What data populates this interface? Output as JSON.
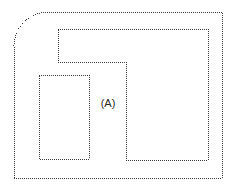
{
  "figure": {
    "width": 232,
    "height": 185,
    "background_color": "#ffffff",
    "stroke_color": "#3a3a3a",
    "stroke_style": "dotted",
    "stroke_width": 1
  },
  "labels": {
    "region_a": "(A)",
    "region_a_x": 108,
    "region_a_y": 104
  },
  "shapes": {
    "outer_boundary": {
      "name": "outer-boundary",
      "description": "outer perimeter with rounded top-left corner",
      "left": 14,
      "top": 12,
      "right": 222,
      "bottom": 178,
      "corner_radius": 34,
      "path": "M 14 178 L 14 46 A 34 34 0 0 1 48 12 L 222 12 L 222 178 Z"
    },
    "inner_l_shape": {
      "name": "inner-l-shape",
      "description": "L-shaped inner outline: upper horizontal band joined to lower right block",
      "top_band_left": 58,
      "top_band_top": 29,
      "top_band_bottom": 62,
      "right_block_left": 126,
      "right_block_right": 208,
      "right_block_bottom": 160,
      "path": "M 58 29 L 208 29 L 208 160 L 126 160 L 126 62 L 58 62 Z"
    },
    "left_rectangle": {
      "name": "left-rectangle",
      "description": "small rectangle at lower left",
      "left": 39,
      "top": 75,
      "right": 89,
      "bottom": 159,
      "path": "M 39 75 L 89 75 L 89 159 L 39 159 Z"
    }
  }
}
